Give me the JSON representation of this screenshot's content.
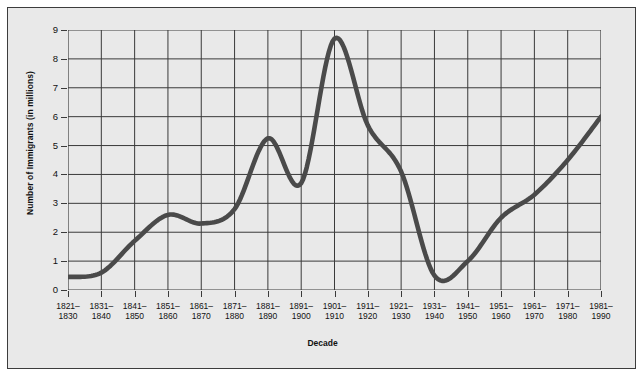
{
  "chart_data": {
    "type": "line",
    "title": "",
    "xlabel": "Decade",
    "ylabel": "Number of Immigrants (in millions)",
    "categories": [
      "1821–\n1830",
      "1831–\n1840",
      "1841–\n1850",
      "1851–\n1860",
      "1861–\n1870",
      "1871–\n1880",
      "1881–\n1890",
      "1891–\n1900",
      "1901–\n1910",
      "1911–\n1920",
      "1921–\n1930",
      "1931–\n1940",
      "1941–\n1950",
      "1951–\n1960",
      "1961–\n1970",
      "1971–\n1980",
      "1981–\n1990"
    ],
    "category_lines": [
      [
        "1821–",
        "1830"
      ],
      [
        "1831–",
        "1840"
      ],
      [
        "1841–",
        "1850"
      ],
      [
        "1851–",
        "1860"
      ],
      [
        "1861–",
        "1870"
      ],
      [
        "1871–",
        "1880"
      ],
      [
        "1881–",
        "1890"
      ],
      [
        "1891–",
        "1900"
      ],
      [
        "1901–",
        "1910"
      ],
      [
        "1911–",
        "1920"
      ],
      [
        "1921–",
        "1930"
      ],
      [
        "1931–",
        "1940"
      ],
      [
        "1941–",
        "1950"
      ],
      [
        "1951–",
        "1960"
      ],
      [
        "1961–",
        "1970"
      ],
      [
        "1971–",
        "1980"
      ],
      [
        "1981–",
        "1990"
      ]
    ],
    "values": [
      0.45,
      0.6,
      1.7,
      2.6,
      2.3,
      2.8,
      5.25,
      3.7,
      8.7,
      5.7,
      4.1,
      0.5,
      1.0,
      2.5,
      3.3,
      4.5,
      6.0
    ],
    "ylim": [
      0,
      9
    ],
    "yticks": [
      0,
      1,
      2,
      3,
      4,
      5,
      6,
      7,
      8,
      9
    ],
    "ytick_labels": [
      "0",
      "1",
      "2",
      "3",
      "4",
      "5",
      "6",
      "7",
      "8",
      "9"
    ],
    "grid": true,
    "legend": "none",
    "series_name": "Immigrants",
    "colors": {
      "line": "#4a4a4a",
      "grid": "#3a3a3a",
      "panel_background": "#e9e9e9",
      "page_background": "#ffffff",
      "border": "#3c3c3c",
      "text": "#111111"
    }
  }
}
